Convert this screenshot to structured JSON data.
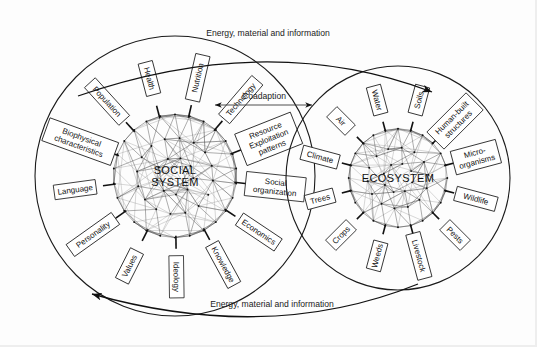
{
  "figure": {
    "background": "#fdfdfd",
    "ink": "#111111"
  },
  "systems": [
    {
      "id": "social-system",
      "center_label_line1": "SOCIAL",
      "center_label_line2": "SYSTEM",
      "cx": 175,
      "cy": 176,
      "r": 140,
      "components": [
        "Nutrition",
        "Technology",
        "Resource Exploitation patterns",
        "Social organization",
        "Economics",
        "Knowledge",
        "Ideology",
        "Values",
        "Personality",
        "Language",
        "Biophysical characteristics",
        "Population",
        "Health"
      ]
    },
    {
      "id": "ecosystem",
      "center_label_line1": "ECOSYSTEM",
      "center_label_line2": "",
      "cx": 398,
      "cy": 178,
      "r": 112,
      "components": [
        "Soils",
        "Human-built structures",
        "Micro-organisms",
        "Wildlife",
        "Pests",
        "Livestock",
        "Weeds",
        "Crops",
        "Trees",
        "Climate",
        "Air",
        "Water"
      ]
    }
  ],
  "connectors": {
    "top_flow_label": "Energy, material and information",
    "bottom_flow_label": "Energy, material and information",
    "middle_label": "Coadaption",
    "top_flow_direction": "left-to-right",
    "bottom_flow_direction": "right-to-left",
    "middle_direction": "bidirectional"
  }
}
